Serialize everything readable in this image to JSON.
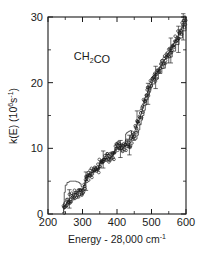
{
  "chart_data": {
    "type": "scatter",
    "title": "",
    "annotation": "CH2CO",
    "annotation_display": "CH₂CO",
    "xlabel": "Energy - 28,000 cm-1",
    "xlabel_parts": {
      "main": "Energy - 28,000 cm",
      "sup": "-1"
    },
    "ylabel": "k(E) (106s-1)",
    "ylabel_parts": {
      "pre": "k(E) (10",
      "sup1": "6",
      "mid": "s",
      "sup2": "-1",
      "post": ")"
    },
    "xlim": [
      200,
      600
    ],
    "ylim": [
      0,
      30
    ],
    "xticks": [
      200,
      300,
      400,
      500,
      600
    ],
    "yticks": [
      0,
      10,
      20,
      30
    ],
    "xticklabels": [
      "200",
      "300",
      "400",
      "500",
      "600"
    ],
    "yticklabels": [
      "0",
      "10",
      "20",
      "30"
    ],
    "x_minor_interval": 50,
    "y_minor_interval": 5,
    "grid": false,
    "legend": false,
    "ticks_direction": "in",
    "frame": "box",
    "series": [
      {
        "name": "experiment",
        "marker": "open-circle",
        "x": [
          246,
          250,
          254,
          258,
          262,
          266,
          270,
          274,
          278,
          282,
          286,
          290,
          294,
          298,
          302,
          306,
          310,
          314,
          318,
          322,
          326,
          330,
          334,
          338,
          342,
          346,
          350,
          354,
          358,
          362,
          366,
          370,
          374,
          378,
          382,
          386,
          390,
          394,
          398,
          402,
          406,
          410,
          414,
          418,
          422,
          426,
          430,
          434,
          438,
          442,
          446,
          450,
          454,
          458,
          462,
          466,
          470,
          474,
          478,
          482,
          486,
          490,
          494,
          498,
          502,
          506,
          510,
          514,
          518,
          522,
          526,
          530,
          534,
          538,
          542,
          546,
          550,
          554,
          558,
          562,
          566,
          570,
          574,
          578,
          582,
          586,
          590,
          594,
          598
        ],
        "y": [
          0.6,
          1.1,
          1.6,
          2.0,
          2.3,
          2.6,
          2.8,
          3.0,
          3.1,
          3.2,
          3.3,
          3.3,
          3.4,
          3.5,
          3.9,
          4.4,
          5.0,
          5.5,
          5.9,
          6.1,
          6.3,
          6.4,
          6.5,
          6.6,
          6.7,
          6.9,
          7.6,
          8.0,
          8.3,
          8.4,
          8.4,
          8.5,
          8.6,
          8.6,
          8.7,
          8.8,
          9.0,
          9.6,
          10.0,
          10.2,
          10.1,
          9.9,
          9.9,
          10.1,
          10.3,
          10.4,
          10.5,
          10.6,
          10.8,
          11.2,
          11.8,
          12.4,
          13.0,
          13.6,
          14.1,
          14.6,
          15.2,
          16.0,
          16.8,
          17.6,
          18.2,
          18.7,
          19.2,
          19.6,
          20.0,
          20.4,
          20.8,
          21.2,
          21.6,
          22.0,
          22.4,
          22.8,
          23.1,
          23.4,
          23.7,
          24.1,
          24.5,
          24.9,
          25.3,
          25.7,
          26.1,
          26.5,
          26.9,
          27.3,
          27.7,
          28.1,
          28.5,
          28.9,
          29.3
        ]
      },
      {
        "name": "rrkm-theory",
        "style": "stepped-line",
        "x": [
          243,
          245,
          247,
          250,
          255,
          260,
          263,
          266,
          270,
          276,
          282,
          288,
          292,
          296,
          299,
          302,
          304,
          307,
          310,
          314,
          318,
          322,
          327,
          332,
          337,
          342,
          346,
          350,
          352,
          355,
          358,
          362,
          366,
          370,
          375,
          380,
          385,
          390,
          394,
          397,
          400,
          403,
          406,
          410,
          414,
          418,
          422,
          425,
          428,
          431,
          434,
          438,
          442,
          446,
          450,
          454,
          458,
          462,
          466,
          470,
          474,
          478,
          482,
          486,
          490,
          494,
          498,
          502,
          510,
          520,
          530,
          540,
          550,
          560,
          570,
          580,
          590,
          600
        ],
        "y": [
          0.2,
          1.6,
          3.3,
          4.4,
          4.8,
          4.9,
          5.0,
          5.0,
          5.0,
          5.0,
          4.9,
          4.8,
          4.6,
          4.2,
          3.7,
          3.9,
          4.4,
          5.1,
          5.6,
          6.0,
          6.2,
          6.3,
          6.4,
          6.5,
          6.6,
          6.7,
          7.0,
          7.8,
          8.2,
          8.3,
          8.4,
          8.4,
          8.5,
          8.5,
          8.6,
          8.7,
          8.9,
          9.3,
          9.9,
          10.2,
          10.2,
          10.0,
          9.8,
          9.8,
          10.0,
          10.2,
          10.4,
          12.2,
          12.4,
          12.5,
          12.6,
          12.7,
          12.0,
          11.4,
          11.2,
          11.4,
          12.0,
          12.8,
          13.6,
          14.3,
          15.0,
          15.8,
          16.6,
          17.4,
          18.1,
          18.7,
          19.3,
          19.8,
          20.6,
          21.4,
          22.2,
          23.0,
          23.9,
          24.8,
          25.8,
          26.8,
          27.9,
          29.2
        ]
      }
    ],
    "error_bars": [
      {
        "x": 262,
        "y": 2.3,
        "err": 1.4
      },
      {
        "x": 310,
        "y": 5.0,
        "err": 1.4
      },
      {
        "x": 360,
        "y": 8.3,
        "err": 1.3
      },
      {
        "x": 410,
        "y": 9.9,
        "err": 1.3
      },
      {
        "x": 436,
        "y": 10.5,
        "err": 1.5
      },
      {
        "x": 458,
        "y": 14.1,
        "err": 1.6
      },
      {
        "x": 490,
        "y": 18.3,
        "err": 1.6
      },
      {
        "x": 512,
        "y": 20.8,
        "err": 1.7
      },
      {
        "x": 556,
        "y": 24.9,
        "err": 1.9
      },
      {
        "x": 578,
        "y": 26.6,
        "err": 2.0
      },
      {
        "x": 592,
        "y": 28.5,
        "err": 2.0
      }
    ]
  },
  "colors": {
    "ink": "#1a1a1a",
    "background": "#ffffff",
    "curve": "#2a2a2a"
  }
}
